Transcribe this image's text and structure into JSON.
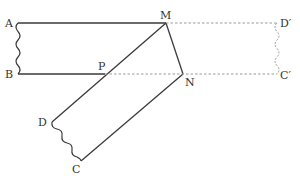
{
  "diagram": {
    "colors": {
      "line": "#3a3a3a",
      "dashed": "#9a9a9a",
      "label": "#333333"
    },
    "points": {
      "A": {
        "label": "A",
        "x": 18,
        "y": 23
      },
      "B": {
        "label": "B",
        "x": 18,
        "y": 74
      },
      "M": {
        "label": "M",
        "x": 166,
        "y": 23
      },
      "N": {
        "label": "N",
        "x": 183,
        "y": 74
      },
      "P": {
        "label": "P",
        "x": 105,
        "y": 74
      },
      "D": {
        "label": "D",
        "x": 52,
        "y": 122
      },
      "C": {
        "label": "C",
        "x": 81,
        "y": 161
      },
      "D_prime": {
        "label": "D′",
        "x": 277,
        "y": 23
      },
      "C_prime": {
        "label": "C′",
        "x": 277,
        "y": 74
      }
    },
    "segments_solid": [
      "AM",
      "BP",
      "MN",
      "MD",
      "NC"
    ],
    "segments_dashed": [
      "MD′",
      "PC′"
    ],
    "wavy_edges_solid": [
      "AB",
      "DC"
    ],
    "wavy_edges_dashed": [
      "D′C′"
    ]
  }
}
